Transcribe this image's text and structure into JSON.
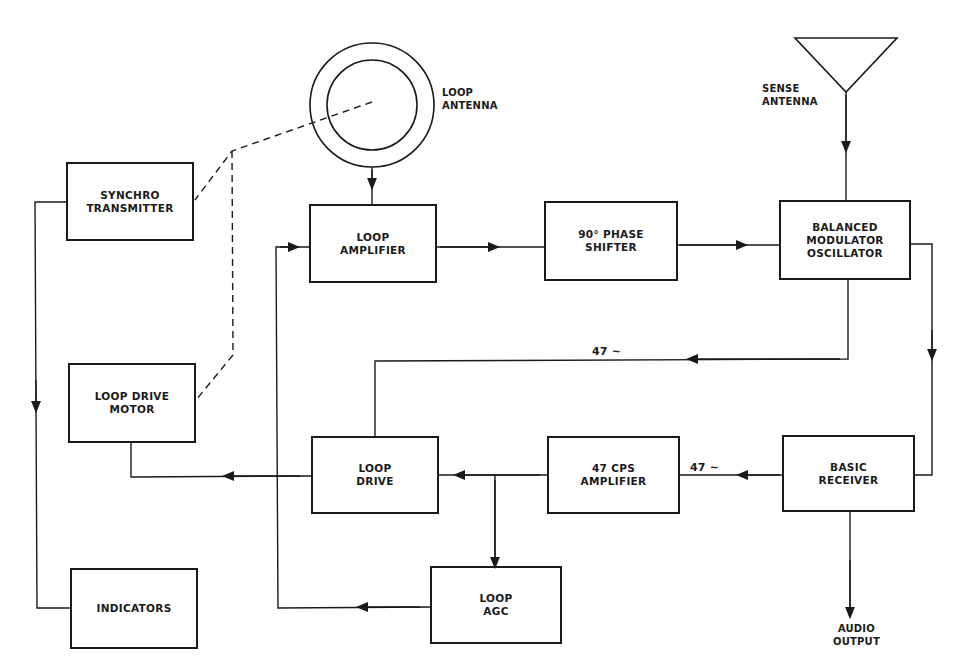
{
  "diagram": {
    "type": "block-diagram",
    "blocks": {
      "synchro_transmitter": "SYNCHRO\nTRANSMITTER",
      "loop_drive_motor": "LOOP DRIVE\nMOTOR",
      "indicators": "INDICATORS",
      "loop_amplifier": "LOOP\nAMPLIFIER",
      "phase_shifter": "90° PHASE\nSHIFTER",
      "balanced_modulator": "BALANCED\nMODULATOR\nOSCILLATOR",
      "loop_drive": "LOOP\nDRIVE",
      "cps_amplifier": "47 CPS\nAMPLIFIER",
      "basic_receiver": "BASIC\nRECEIVER",
      "loop_agc": "LOOP\nAGC"
    },
    "labels": {
      "loop_antenna": "LOOP\nANTENNA",
      "sense_antenna": "SENSE\nANTENNA",
      "audio_output": "AUDIO\nOUTPUT",
      "signal_47_top": "47 ∼",
      "signal_47_mid": "47 ∼"
    },
    "connections": [
      {
        "from": "loop_antenna",
        "to": "loop_amplifier"
      },
      {
        "from": "loop_amplifier",
        "to": "phase_shifter"
      },
      {
        "from": "phase_shifter",
        "to": "balanced_modulator"
      },
      {
        "from": "sense_antenna",
        "to": "balanced_modulator"
      },
      {
        "from": "balanced_modulator",
        "to": "basic_receiver"
      },
      {
        "from": "balanced_modulator",
        "to": "loop_drive",
        "label": "47 ∼"
      },
      {
        "from": "basic_receiver",
        "to": "cps_amplifier",
        "label": "47 ∼"
      },
      {
        "from": "basic_receiver",
        "to": "audio_output"
      },
      {
        "from": "cps_amplifier",
        "to": "loop_drive"
      },
      {
        "from": "cps_amplifier",
        "to": "loop_agc"
      },
      {
        "from": "loop_agc",
        "to": "loop_amplifier"
      },
      {
        "from": "loop_drive",
        "to": "loop_drive_motor"
      },
      {
        "from": "synchro_transmitter",
        "to": "indicators"
      },
      {
        "from": "loop_antenna",
        "to": "synchro_transmitter",
        "style": "dashed",
        "kind": "mechanical"
      },
      {
        "from": "loop_antenna",
        "to": "loop_drive_motor",
        "style": "dashed",
        "kind": "mechanical"
      }
    ],
    "colors": {
      "ink": "#1a1a1a",
      "background": "#ffffff"
    }
  }
}
